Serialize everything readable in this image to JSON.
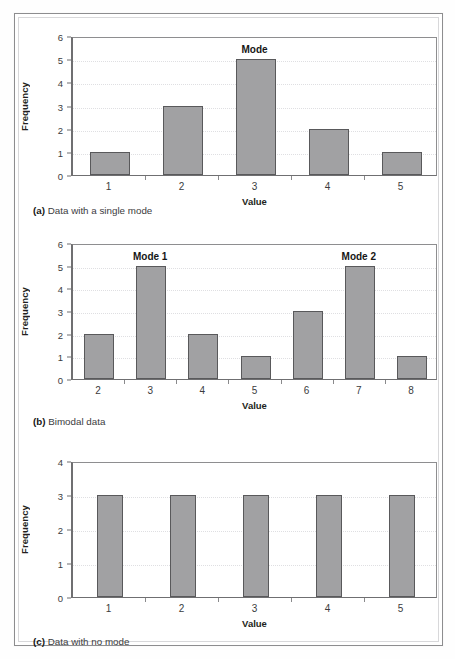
{
  "figure": {
    "panels": [
      {
        "id": "a",
        "caption_tag": "(a)",
        "caption_text": "Data with a single mode"
      },
      {
        "id": "b",
        "caption_tag": "(b)",
        "caption_text": "Bimodal data"
      },
      {
        "id": "c",
        "caption_tag": "(c)",
        "caption_text": "Data with no mode"
      }
    ]
  },
  "chart_data": [
    {
      "type": "bar",
      "title": "",
      "panel": "a",
      "xlabel": "Value",
      "ylabel": "Frequency",
      "categories": [
        "1",
        "2",
        "3",
        "4",
        "5"
      ],
      "values": [
        1,
        3,
        5,
        2,
        1
      ],
      "ylim": [
        0,
        6
      ],
      "yticks": [
        0,
        1,
        2,
        3,
        4,
        5,
        6
      ],
      "grid": true,
      "legend": "none",
      "annotations": [
        {
          "text": "Mode",
          "category": "3",
          "value": 5
        }
      ]
    },
    {
      "type": "bar",
      "title": "",
      "panel": "b",
      "xlabel": "Value",
      "ylabel": "Frequency",
      "categories": [
        "2",
        "3",
        "4",
        "5",
        "6",
        "7",
        "8"
      ],
      "values": [
        2,
        5,
        2,
        1,
        3,
        5,
        1
      ],
      "ylim": [
        0,
        6
      ],
      "yticks": [
        0,
        1,
        2,
        3,
        4,
        5,
        6
      ],
      "grid": true,
      "legend": "none",
      "annotations": [
        {
          "text": "Mode 1",
          "category": "3",
          "value": 5
        },
        {
          "text": "Mode 2",
          "category": "7",
          "value": 5
        }
      ]
    },
    {
      "type": "bar",
      "title": "",
      "panel": "c",
      "xlabel": "Value",
      "ylabel": "Frequency",
      "categories": [
        "1",
        "2",
        "3",
        "4",
        "5"
      ],
      "values": [
        3,
        3,
        3,
        3,
        3
      ],
      "ylim": [
        0,
        4
      ],
      "yticks": [
        0,
        1,
        2,
        3,
        4
      ],
      "grid": true,
      "legend": "none",
      "annotations": []
    }
  ],
  "colors": {
    "bar_fill": "#a1a1a3",
    "bar_stroke": "#59595b",
    "axis": "#6f6f71",
    "grid": "#dfdfe2",
    "text": "#231f20",
    "frame": "#8d8d8f"
  }
}
